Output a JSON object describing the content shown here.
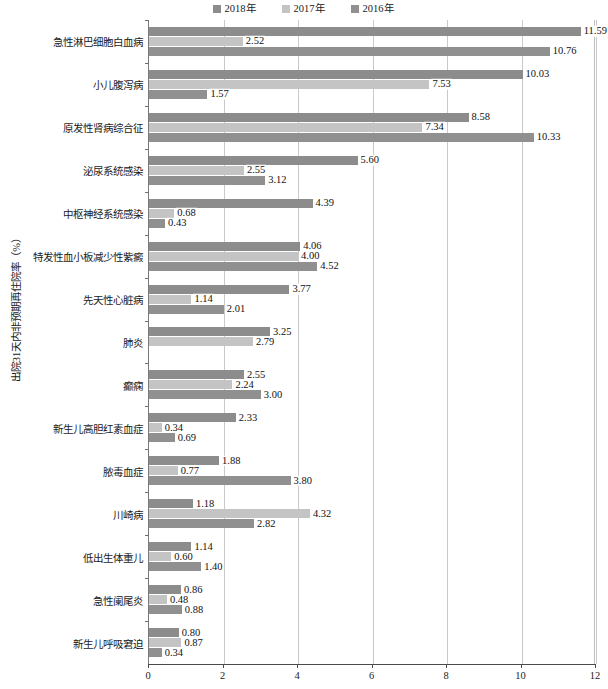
{
  "chart_data": {
    "type": "bar",
    "orientation": "horizontal",
    "title": "",
    "xlabel": "",
    "ylabel": "出院31天内非预期再住院率（%）",
    "xlim": [
      0,
      12
    ],
    "xticks": [
      "0",
      "2",
      "4",
      "6",
      "8",
      "10",
      "12"
    ],
    "grid": true,
    "legend_position": "top-center",
    "categories": [
      "急性淋巴细胞白血病",
      "小儿腹泻病",
      "原发性肾病综合征",
      "泌尿系统感染",
      "中枢神经系统感染",
      "特发性血小板减少性紫癜",
      "先天性心脏病",
      "肺炎",
      "癫痫",
      "新生儿高胆红素血症",
      "脓毒血症",
      "川崎病",
      "低出生体重儿",
      "急性阑尾炎",
      "新生儿呼吸窘迫"
    ],
    "series": [
      {
        "name": "2018年",
        "color": "#8c8c8c",
        "values": [
          11.59,
          10.03,
          8.58,
          5.6,
          4.39,
          4.06,
          3.77,
          3.25,
          2.55,
          2.33,
          1.88,
          1.18,
          1.14,
          0.86,
          0.8
        ],
        "labels": [
          "11.59",
          "10.03",
          "8.58",
          "5.60",
          "4.39",
          "4.06",
          "3.77",
          "3.25",
          "2.55",
          "2.33",
          "1.88",
          "1.18",
          "1.14",
          "0.86",
          "0.80"
        ]
      },
      {
        "name": "2017年",
        "color": "#c4c4c4",
        "values": [
          2.52,
          7.53,
          7.34,
          2.55,
          0.68,
          4.0,
          1.14,
          2.79,
          2.24,
          0.34,
          0.77,
          4.32,
          0.6,
          0.48,
          0.87
        ],
        "labels": [
          "2.52",
          "7.53",
          "7.34",
          "2.55",
          "0.68",
          "4.00",
          "1.14",
          "2.79",
          "2.24",
          "0.34",
          "0.77",
          "4.32",
          "0.60",
          "0.48",
          "0.87"
        ]
      },
      {
        "name": "2016年",
        "color": "#909090",
        "values": [
          10.76,
          1.57,
          10.33,
          3.12,
          0.43,
          4.52,
          2.01,
          null,
          3.0,
          0.69,
          3.8,
          2.82,
          1.4,
          0.88,
          0.34
        ],
        "labels": [
          "10.76",
          "1.57",
          "10.33",
          "3.12",
          "0.43",
          "4.52",
          "2.01",
          "",
          "3.00",
          "0.69",
          "3.80",
          "2.82",
          "1.40",
          "0.88",
          "0.34"
        ]
      }
    ]
  },
  "legend": {
    "items": [
      {
        "label": "2018年",
        "color": "#8c8c8c"
      },
      {
        "label": "2017年",
        "color": "#c4c4c4"
      },
      {
        "label": "2016年",
        "color": "#909090"
      }
    ]
  },
  "axis": {
    "y_title": "出院31天内非预期再住院率（%）",
    "x_ticks": [
      "0",
      "2",
      "4",
      "6",
      "8",
      "10",
      "12"
    ]
  },
  "footnote": ""
}
